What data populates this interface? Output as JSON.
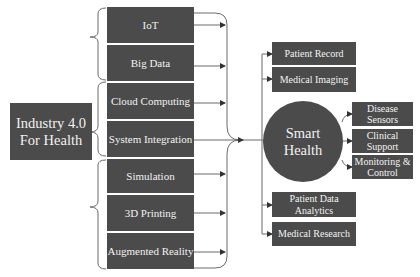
{
  "diagram": {
    "source": "Industry 4.0\nFor Health",
    "technologies": [
      {
        "label": "IoT",
        "top": 7,
        "height": 36
      },
      {
        "label": "Big Data",
        "top": 45,
        "height": 36
      },
      {
        "label": "Cloud Computing",
        "top": 83,
        "height": 36
      },
      {
        "label": "System Integration",
        "top": 121,
        "height": 36
      },
      {
        "label": "Simulation",
        "top": 159,
        "height": 34
      },
      {
        "label": "3D Printing",
        "top": 195,
        "height": 36
      },
      {
        "label": "Augmented Reality",
        "top": 233,
        "height": 36
      }
    ],
    "hub": "Smart\nHealth",
    "outputs": [
      {
        "label": "Patient Record",
        "top": 42,
        "height": 23
      },
      {
        "label": "Medical Imaging",
        "top": 67,
        "height": 25
      },
      {
        "label": "Patient Data Analytics",
        "top": 192,
        "height": 25
      },
      {
        "label": "Medical Research",
        "top": 222,
        "height": 24
      }
    ],
    "hub_outputs": [
      {
        "label": "Disease Sensors",
        "top": 102,
        "height": 24
      },
      {
        "label": "Clinical Support",
        "top": 129,
        "height": 24
      },
      {
        "label": "Monitoring & Control",
        "top": 155,
        "height": 24
      }
    ],
    "colors": {
      "box_fill": "#4b4b4b",
      "box_text": "#f2f2f2",
      "line": "#6a6a6a"
    }
  }
}
